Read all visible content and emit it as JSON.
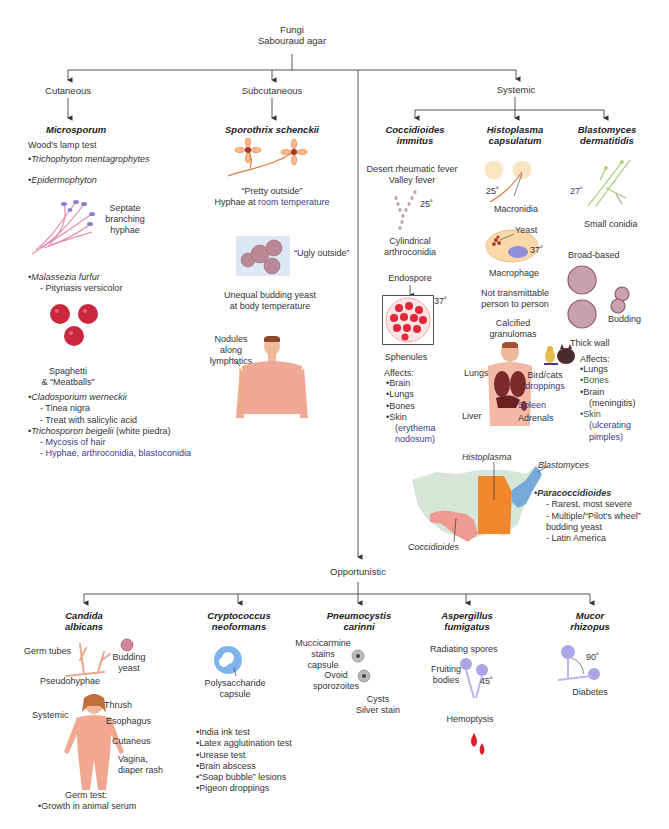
{
  "root": {
    "line1": "Fungi",
    "line2": "Sabouraud agar"
  },
  "categories": {
    "cutaneous": "Cutaneous",
    "subcutaneous": "Subcutaneous",
    "systemic": "Systemic",
    "opportunistic": "Opportunistic"
  },
  "cutaneous": {
    "title": "Microsporum",
    "test": "Wood's lamp test",
    "items": [
      "Trichophyton mentagrophytes",
      "Epidermophyton"
    ],
    "hyphae_label": [
      "Septate",
      "branching",
      "hyphae"
    ],
    "malassezia": {
      "name": "Malassezia furfur",
      "sub": "Pityriasis versicolor"
    },
    "meatballs_label": [
      "Spaghetti",
      "& “Meatballs”"
    ],
    "cladosporium": {
      "name": "Cladosporium werneckii",
      "subs": [
        "Tinea nigra",
        "Treat with salicylic acid"
      ]
    },
    "trichosporon": {
      "name": "Trichosporon beigelii",
      "suffix": " (white piedra)",
      "subs": [
        "Mycosis of hair",
        "Hyphae, arthroconidia, blastoconidia"
      ]
    }
  },
  "subcutaneous": {
    "title": "Sporothrix schenckii",
    "pretty": "“Pretty outside”",
    "hyphae_prefix": "Hyphae at ",
    "hyphae_room": "room temperature",
    "ugly": "“Ugly outside”",
    "yeast": [
      "Unequal budding yeast",
      "at body temperature"
    ],
    "nodules": [
      "Nodules",
      "along",
      "lymphatics"
    ]
  },
  "systemic": {
    "coccidioides": {
      "title": [
        "Coccidioides",
        "immitus"
      ],
      "fevers": [
        "Desert rheumatic fever",
        "Valley fever"
      ],
      "temp_25": "25˚",
      "arthro": [
        "Cylindrical",
        "arthroconidia"
      ],
      "endospore": "Endospore",
      "temp_37": "37˚",
      "sphenules": "Sphenules",
      "affects_label": "Affects:",
      "affects": [
        "Brain",
        "Lungs",
        "Bones",
        "Skin"
      ],
      "skin_note": [
        "(erythema",
        "nodosum)"
      ]
    },
    "histoplasma": {
      "title": [
        "Histoplasma",
        "capsulatum"
      ],
      "temp_25": "25˚",
      "macronidia": "Macronidia",
      "yeast": "Yeast",
      "temp_37": "37˚",
      "macrophage": "Macrophage",
      "not_transmittable": [
        "Not transmittable",
        "person to person"
      ],
      "granulomas": [
        "Calcified",
        "granulomas"
      ],
      "organs": {
        "lungs": "Lungs",
        "liver": "Liver",
        "spleen": "Spleen",
        "adrenals": "Adrenals"
      },
      "droppings": [
        "Bird/cats",
        "droppings"
      ]
    },
    "blastomyces": {
      "title": [
        "Blastomyces",
        "dermatitidis"
      ],
      "temp_27": "27˚",
      "small_conidia": "Small conidia",
      "broad_based": "Broad-based",
      "budding": "Budding",
      "thick_wall": "Thick wall",
      "affects_label": "Affects:",
      "affects": [
        "Lungs",
        "Bones",
        "Brain",
        "Skin"
      ],
      "brain_note": "(meningitis)",
      "skin_note": [
        "(ulcerating",
        "pimples)"
      ]
    },
    "map": {
      "histoplasma": "Histoplasma",
      "blastomyces": "Blastomyces",
      "coccidioides": "Coccidioides",
      "colors": {
        "base": "#d5e6d8",
        "histoplasma": "#f0862e",
        "blastomyces": "#74a9d8",
        "coccidioides": "#ef9a90"
      }
    },
    "paracoccidioides": {
      "name": "Paracoccidioides",
      "subs": [
        "Rarest, most severe",
        "Multiple/“Pilot's wheel”",
        "budding yeast",
        "Latin America"
      ]
    }
  },
  "opportunistic": {
    "candida": {
      "title": [
        "Candida",
        "albicans"
      ],
      "germ_tubes": "Germ tubes",
      "budding": [
        "Budding",
        "yeast"
      ],
      "pseudohyphae": "Pseudohyphae",
      "body": {
        "thrush": "Thrush",
        "systemic": "Systemic",
        "esophagus": "Esophagus",
        "cutaneus": "Cutaneus",
        "vagina": [
          "Vagina,",
          "diaper rash"
        ]
      },
      "germ_test": "Germ test:",
      "germ_item": "Growth in animal serum"
    },
    "cryptococcus": {
      "title": [
        "Cryptococcus",
        "neoformans"
      ],
      "capsule": [
        "Polysaccharide",
        "capsule"
      ],
      "items": [
        "India ink test",
        "Latex agglutination test",
        "Urease test",
        "Brain abscess",
        "“Soap bubble” lesions",
        "Pigeon droppings"
      ]
    },
    "pneumocystis": {
      "title": [
        "Pneumocystis",
        "carinni"
      ],
      "mucci": [
        "Muccicarmine",
        "stains",
        "capsule"
      ],
      "ovoid": [
        "Ovoid",
        "sporozoites"
      ],
      "cysts": [
        "Cysts",
        "Silver stain"
      ]
    },
    "aspergillus": {
      "title": [
        "Aspergillus",
        "fumigatus"
      ],
      "radiating": "Radiating spores",
      "fruiting": [
        "Fruiting",
        "bodies"
      ],
      "angle": "45˚",
      "hemoptysis": "Hemoptysis"
    },
    "mucor": {
      "title": [
        "Mucor",
        "rhizopus"
      ],
      "angle": "90˚",
      "diabetes": "Diabetes"
    }
  },
  "caption": "Classification of fungi (partially cut off at bottom edge)"
}
